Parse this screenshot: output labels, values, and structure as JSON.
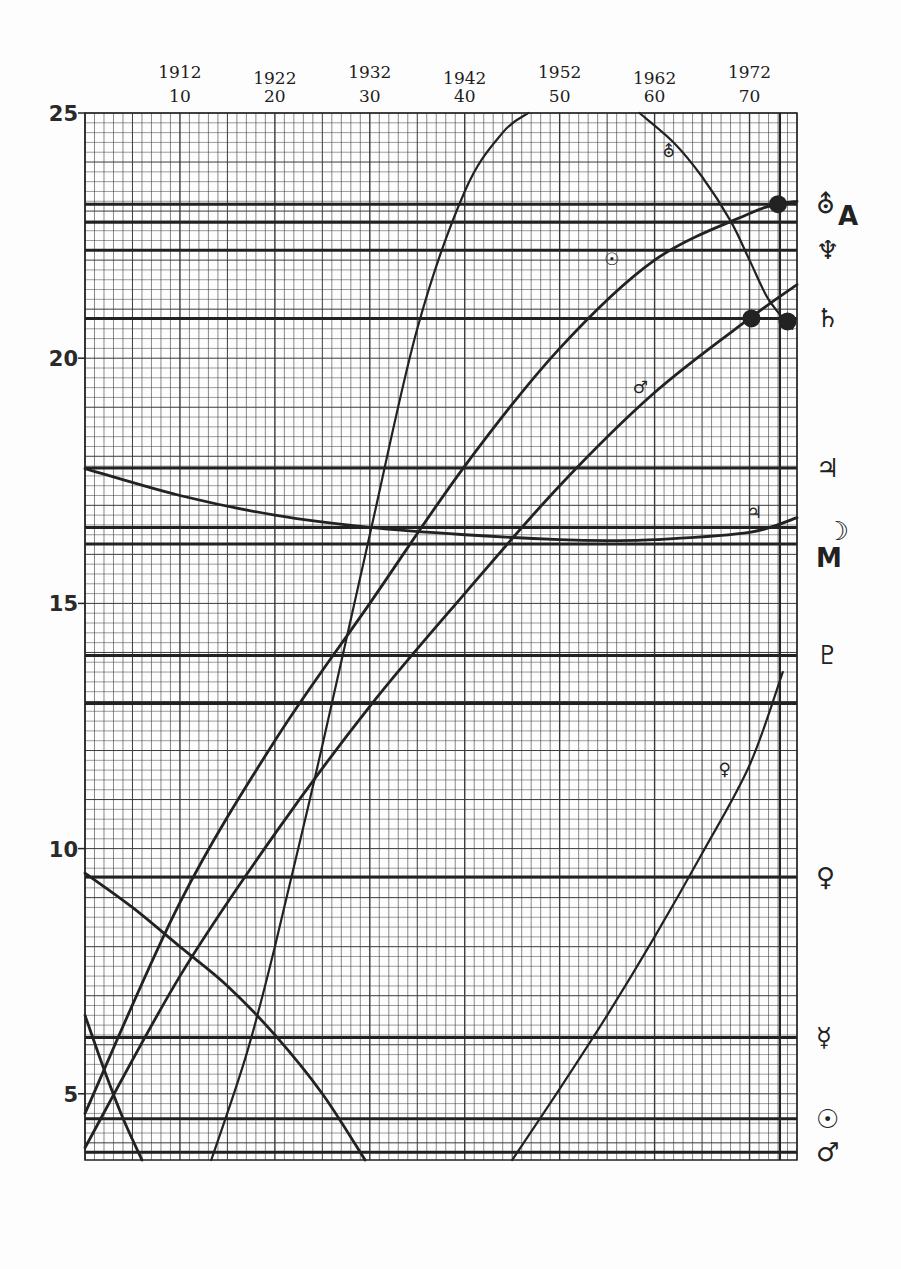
{
  "chart_data": {
    "type": "line",
    "title": "",
    "xlabel": "",
    "ylabel": "",
    "xlim": [
      0,
      75
    ],
    "ylim": [
      3.65,
      25
    ],
    "grid": true,
    "x_ticks": [
      {
        "value": 10,
        "year": "1912",
        "label": "10"
      },
      {
        "value": 20,
        "year": "1922",
        "label": "20"
      },
      {
        "value": 30,
        "year": "1932",
        "label": "30"
      },
      {
        "value": 40,
        "year": "1942",
        "label": "40"
      },
      {
        "value": 50,
        "year": "1952",
        "label": "50"
      },
      {
        "value": 60,
        "year": "1962",
        "label": "60"
      },
      {
        "value": 70,
        "year": "1972",
        "label": "70"
      }
    ],
    "y_ticks": [
      {
        "value": 25,
        "label": "25"
      },
      {
        "value": 20,
        "label": "20"
      },
      {
        "value": 15,
        "label": "15"
      },
      {
        "value": 10,
        "label": "10"
      },
      {
        "value": 5,
        "label": "5"
      }
    ],
    "reference_lines": [
      {
        "value": 23.14,
        "symbol": "⛢",
        "name": "uranus"
      },
      {
        "value": 22.77,
        "symbol": "A",
        "name": "a"
      },
      {
        "value": 22.2,
        "symbol": "♆",
        "name": "neptune"
      },
      {
        "value": 20.81,
        "symbol": "♄",
        "name": "saturn"
      },
      {
        "value": 17.76,
        "symbol": "♃",
        "name": "jupiter"
      },
      {
        "value": 16.55,
        "symbol": "☽",
        "name": "moon"
      },
      {
        "value": 16.21,
        "symbol": "M",
        "name": "m"
      },
      {
        "value": 13.94,
        "symbol": "♇",
        "name": "pluto"
      },
      {
        "value": 12.96,
        "symbol": "",
        "name": "unlabeled"
      },
      {
        "value": 9.42,
        "symbol": "♀",
        "name": "venus"
      },
      {
        "value": 6.15,
        "symbol": "☿",
        "name": "mercury"
      },
      {
        "value": 4.49,
        "symbol": "☉",
        "name": "sun"
      },
      {
        "value": 3.81,
        "symbol": "♂",
        "name": "mars"
      }
    ],
    "vertical_marker": {
      "value": 73.2
    },
    "series": [
      {
        "name": "sun-curve",
        "label": "☉",
        "label_at": [
          55.5,
          21.9
        ],
        "x": [
          0,
          10,
          20,
          30,
          40,
          50,
          60,
          70,
          73,
          75
        ],
        "y": [
          4.6,
          8.9,
          12.2,
          15.0,
          17.8,
          20.2,
          22.0,
          22.95,
          23.14,
          23.2
        ]
      },
      {
        "name": "mars-curve",
        "label": "♂",
        "label_at": [
          58.5,
          19.3
        ],
        "x": [
          0,
          10,
          20,
          30,
          40,
          50,
          60,
          70,
          75
        ],
        "y": [
          3.9,
          7.4,
          10.3,
          12.9,
          15.2,
          17.4,
          19.3,
          20.81,
          21.5
        ]
      },
      {
        "name": "steep-curve",
        "label": "",
        "x": [
          13.3,
          17,
          20,
          25,
          30,
          35,
          40,
          44,
          46.7
        ],
        "y": [
          3.65,
          5.8,
          8.0,
          12.1,
          16.4,
          20.6,
          23.4,
          24.6,
          25
        ]
      },
      {
        "name": "jupiter-curve",
        "label": "♃",
        "label_at": [
          70.5,
          16.75
        ],
        "x": [
          0,
          10,
          20,
          30,
          40,
          50,
          55,
          60,
          70,
          75
        ],
        "y": [
          17.75,
          17.2,
          16.8,
          16.55,
          16.4,
          16.3,
          16.28,
          16.3,
          16.45,
          16.75
        ]
      },
      {
        "name": "uranus-curve",
        "label": "⛢",
        "label_at": [
          61.5,
          24.1
        ],
        "x": [
          58.4,
          62,
          65,
          68,
          70,
          72,
          74.5
        ],
        "y": [
          25,
          24.4,
          23.7,
          22.8,
          22.0,
          21.2,
          20.6
        ]
      },
      {
        "name": "descending-curve",
        "label": "",
        "x": [
          0,
          5,
          10,
          15,
          20,
          25,
          29.5
        ],
        "y": [
          9.5,
          8.8,
          8.0,
          7.2,
          6.2,
          5.0,
          3.65
        ]
      },
      {
        "name": "steep-descending-curve",
        "label": "",
        "x": [
          0,
          2,
          4,
          6
        ],
        "y": [
          6.6,
          5.5,
          4.5,
          3.65
        ]
      },
      {
        "name": "venus-curve",
        "label": "♀",
        "label_at": [
          67.4,
          11.5
        ],
        "x": [
          45,
          50,
          55,
          60,
          65,
          70,
          73.5
        ],
        "y": [
          3.65,
          5.1,
          6.6,
          8.2,
          9.9,
          11.7,
          13.6
        ]
      }
    ],
    "markers": [
      {
        "name": "uranus-conjunction-dot",
        "x": 73.0,
        "y": 23.14
      },
      {
        "name": "saturn-mars-dot",
        "x": 70.2,
        "y": 20.81
      },
      {
        "name": "saturn-uranus-dot",
        "x": 74.0,
        "y": 20.75
      }
    ]
  },
  "right_legend": [
    {
      "symbol": "⛢",
      "name": "uranus",
      "value": 23.14
    },
    {
      "symbol": "A",
      "name": "a",
      "value": 22.77
    },
    {
      "symbol": "♆",
      "name": "neptune",
      "value": 22.2
    },
    {
      "symbol": "♄",
      "name": "saturn",
      "value": 20.81
    },
    {
      "symbol": "♃",
      "name": "jupiter",
      "value": 17.76
    },
    {
      "symbol": "☽",
      "name": "moon",
      "value": 16.55
    },
    {
      "symbol": "M",
      "name": "m",
      "value": 16.21
    },
    {
      "symbol": "♇",
      "name": "pluto",
      "value": 13.94
    },
    {
      "symbol": "♀",
      "name": "venus",
      "value": 9.42
    },
    {
      "symbol": "☿",
      "name": "mercury",
      "value": 6.15
    },
    {
      "symbol": "☉",
      "name": "sun",
      "value": 4.49
    },
    {
      "symbol": "♂",
      "name": "mars",
      "value": 3.81
    }
  ],
  "colors": {
    "ink": "#222222",
    "grid_minor": "#3a3a3a",
    "paper": "#fdfdfd"
  }
}
